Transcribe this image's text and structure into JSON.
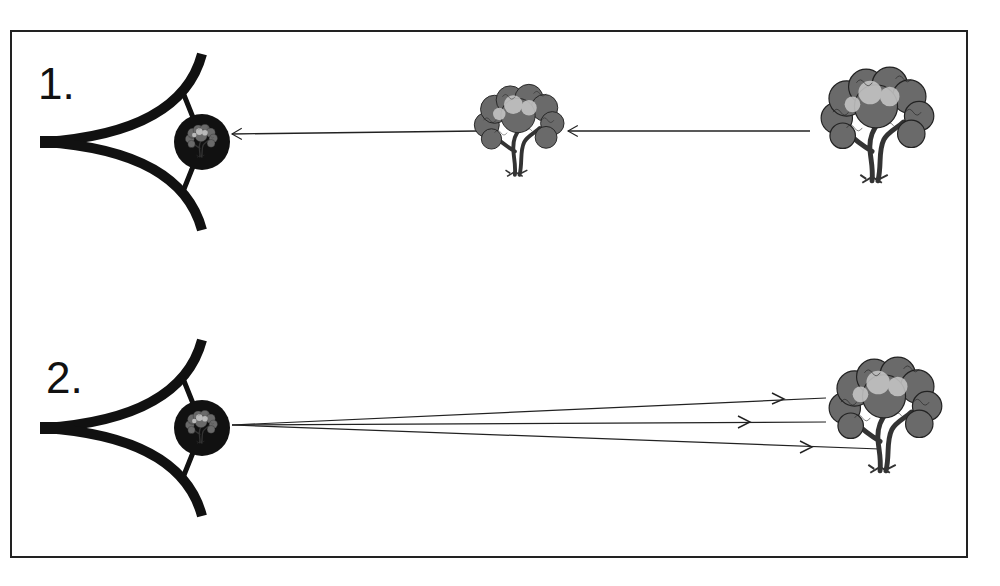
{
  "diagram": {
    "panels": [
      {
        "label": "1.",
        "description": "Light travels from tree to eye (intromission)",
        "elements": [
          "eye",
          "tree-near",
          "tree-far"
        ],
        "arrow_direction": "toward-eye"
      },
      {
        "label": "2.",
        "description": "Rays emitted from eye toward tree (extramission)",
        "elements": [
          "eye",
          "tree"
        ],
        "arrow_direction": "away-from-eye",
        "ray_count": 3
      }
    ],
    "caption": "",
    "colors": {
      "ink": "#111111",
      "frame": "#222222",
      "background": "#ffffff",
      "tree_foliage": "#555555"
    }
  }
}
